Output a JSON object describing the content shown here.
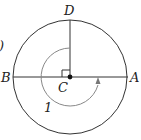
{
  "diagram": {
    "labels": {
      "top": "D",
      "left": "B",
      "right": "A",
      "center": "C",
      "angle": "1",
      "cropped_left": ")"
    },
    "colors": {
      "stroke": "#333333",
      "arc": "#888888",
      "background": "#ffffff"
    }
  }
}
